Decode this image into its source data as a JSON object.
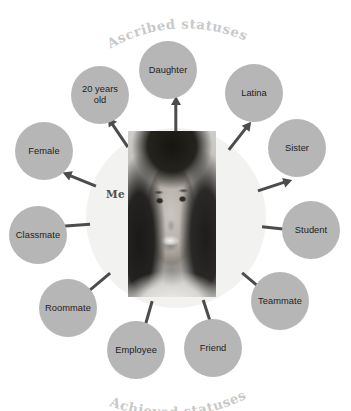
{
  "figure": {
    "top_title": "Ascribed statuses",
    "bottom_title": "Achieved statuses",
    "center_label": "Me",
    "center_portrait_alt": "portrait-photo"
  },
  "colors": {
    "background": "#ffffff",
    "halo": "#f2f2f1",
    "bubble_fill": "#b6b6b6",
    "bubble_text": "#1d1d1d",
    "arrow": "#4c4c4c",
    "title_text": "#c9c9c9",
    "center_label_text": "#4e4e4e"
  },
  "statuses": [
    {
      "label": "Daughter",
      "group": "ascribed",
      "angle": -90,
      "cx": 168,
      "cy": 70,
      "d": 58
    },
    {
      "label": "Latina",
      "group": "ascribed",
      "angle": -45,
      "cx": 254,
      "cy": 93,
      "d": 58
    },
    {
      "label": "Sister",
      "group": "ascribed",
      "angle": -20,
      "cx": 297,
      "cy": 148,
      "d": 58
    },
    {
      "label": "Student",
      "group": "achieved",
      "angle": 8,
      "cx": 311,
      "cy": 230,
      "d": 58
    },
    {
      "label": "Teammate",
      "group": "achieved",
      "angle": 42,
      "cx": 280,
      "cy": 301,
      "d": 58
    },
    {
      "label": "Friend",
      "group": "achieved",
      "angle": 74,
      "cx": 213,
      "cy": 348,
      "d": 58
    },
    {
      "label": "Employee",
      "group": "achieved",
      "angle": 104,
      "cx": 136,
      "cy": 350,
      "d": 58
    },
    {
      "label": "Roommate",
      "group": "achieved",
      "angle": 138,
      "cx": 68,
      "cy": 308,
      "d": 58
    },
    {
      "label": "Classmate",
      "group": "achieved",
      "angle": 172,
      "cx": 38,
      "cy": 235,
      "d": 58
    },
    {
      "label": "Female",
      "group": "ascribed",
      "angle": -160,
      "cx": 44,
      "cy": 151,
      "d": 58
    },
    {
      "label": "20 years\nold",
      "group": "ascribed",
      "angle": -128,
      "cx": 100,
      "cy": 95,
      "d": 58
    }
  ],
  "arrows": [
    {
      "angle": -90,
      "name": "arrow-to-daughter"
    },
    {
      "angle": -52,
      "name": "arrow-to-latina"
    },
    {
      "angle": -18,
      "name": "arrow-to-sister"
    },
    {
      "angle": 6,
      "name": "arrow-to-student"
    },
    {
      "angle": 40,
      "name": "arrow-to-teammate"
    },
    {
      "angle": 72,
      "name": "arrow-to-friend"
    },
    {
      "angle": 106,
      "name": "arrow-to-employee"
    },
    {
      "angle": 140,
      "name": "arrow-to-roommate"
    },
    {
      "angle": 176,
      "name": "arrow-to-classmate"
    },
    {
      "angle": -158,
      "name": "arrow-to-female"
    },
    {
      "angle": -124,
      "name": "arrow-to-20-years-old"
    }
  ],
  "geometry": {
    "halo": {
      "x": 86,
      "y": 128,
      "w": 180,
      "h": 180
    },
    "photo": {
      "x": 128,
      "y": 131,
      "w": 88,
      "h": 166
    },
    "center": {
      "x": 176,
      "y": 218
    },
    "me_label": {
      "x": 106,
      "y": 188
    }
  }
}
